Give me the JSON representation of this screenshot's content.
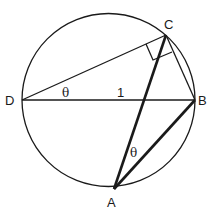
{
  "diagram": {
    "type": "geometry-circle-inscribed",
    "points": {
      "A": {
        "label": "A"
      },
      "B": {
        "label": "B"
      },
      "C": {
        "label": "C"
      },
      "D": {
        "label": "D"
      }
    },
    "labels": {
      "theta_at_D": "θ",
      "theta_at_A": "θ",
      "diameter_length": "1"
    },
    "segments": [
      {
        "from": "D",
        "to": "B",
        "weight": "thin",
        "note": "diameter"
      },
      {
        "from": "D",
        "to": "C",
        "weight": "thin"
      },
      {
        "from": "C",
        "to": "B",
        "weight": "thin"
      },
      {
        "from": "C",
        "to": "A",
        "weight": "thick"
      },
      {
        "from": "A",
        "to": "B",
        "weight": "thick"
      }
    ],
    "right_angle_at": "C"
  }
}
